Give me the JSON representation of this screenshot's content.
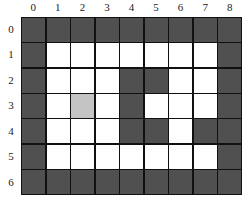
{
  "grid": {
    "columns": [
      "0",
      "1",
      "2",
      "3",
      "4",
      "5",
      "6",
      "7",
      "8"
    ],
    "rows": [
      "0",
      "1",
      "2",
      "3",
      "4",
      "5",
      "6"
    ],
    "legend": {
      "W": "wall",
      "O": "open",
      "M": "marked"
    },
    "colors": {
      "wall": "#505050",
      "open": "#ffffff",
      "marked": "#c4c4c4",
      "border": "#111111"
    },
    "cells": [
      [
        "W",
        "W",
        "W",
        "W",
        "W",
        "W",
        "W",
        "W",
        "W"
      ],
      [
        "W",
        "O",
        "O",
        "O",
        "O",
        "O",
        "O",
        "O",
        "W"
      ],
      [
        "W",
        "O",
        "O",
        "O",
        "W",
        "W",
        "O",
        "O",
        "W"
      ],
      [
        "W",
        "O",
        "M",
        "O",
        "W",
        "O",
        "O",
        "O",
        "W"
      ],
      [
        "W",
        "O",
        "O",
        "O",
        "W",
        "W",
        "O",
        "W",
        "W"
      ],
      [
        "W",
        "O",
        "O",
        "O",
        "O",
        "O",
        "O",
        "O",
        "W"
      ],
      [
        "W",
        "W",
        "W",
        "W",
        "W",
        "W",
        "W",
        "W",
        "W"
      ]
    ]
  }
}
